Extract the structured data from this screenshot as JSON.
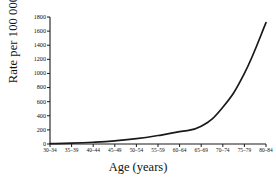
{
  "chart_data": {
    "type": "line",
    "title": "",
    "xlabel": "Age (years)",
    "ylabel": "Rate per 100 000",
    "categories": [
      "30–34",
      "35–39",
      "40–44",
      "45–49",
      "50–54",
      "55–59",
      "60–64",
      "65–69",
      "70–74",
      "75–79",
      "80–84"
    ],
    "values": [
      5,
      12,
      25,
      45,
      75,
      120,
      175,
      250,
      520,
      1000,
      1720
    ],
    "ylim": [
      0,
      1800
    ],
    "ytick_labels": [
      "0",
      "200",
      "400",
      "600",
      "800",
      "1000",
      "1200",
      "1400",
      "1600",
      "1800"
    ],
    "ytick_values": [
      0,
      200,
      400,
      600,
      800,
      1000,
      1200,
      1400,
      1600,
      1800
    ],
    "grid": false,
    "legend": "none",
    "line_color": "#1a1a1a",
    "axis_color": "#1a1a1a"
  }
}
